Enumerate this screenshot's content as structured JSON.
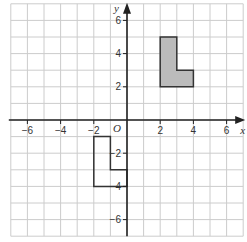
{
  "diagram": {
    "type": "coordinate-grid",
    "x_axis": {
      "label": "x",
      "range": [
        -7,
        7
      ],
      "ticks": [
        -6,
        -4,
        -2,
        2,
        4,
        6
      ],
      "tick_labels": [
        "−6",
        "−4",
        "−2",
        "2",
        "4",
        "6"
      ]
    },
    "y_axis": {
      "label": "y",
      "range": [
        -7,
        7
      ],
      "ticks": [
        6,
        4,
        2,
        -2,
        -4,
        -6
      ],
      "tick_labels": [
        "6",
        "4",
        "2",
        "−2",
        "−4",
        "−6"
      ]
    },
    "origin_label": "O",
    "shapes": [
      {
        "name": "shaded-L-shape",
        "fill": "#bbbbbb",
        "stroke": "#333333",
        "vertices": [
          [
            2,
            5
          ],
          [
            3,
            5
          ],
          [
            3,
            3
          ],
          [
            4,
            3
          ],
          [
            4,
            2
          ],
          [
            2,
            2
          ]
        ]
      },
      {
        "name": "unshaded-L-shape",
        "fill": "none",
        "stroke": "#333333",
        "vertices": [
          [
            -2,
            -1
          ],
          [
            -1,
            -1
          ],
          [
            -1,
            -3
          ],
          [
            0,
            -3
          ],
          [
            0,
            -4
          ],
          [
            -2,
            -4
          ]
        ]
      }
    ],
    "colors": {
      "grid": "#cccccc",
      "axis": "#222222",
      "shaded": "#bbbbbb"
    }
  }
}
